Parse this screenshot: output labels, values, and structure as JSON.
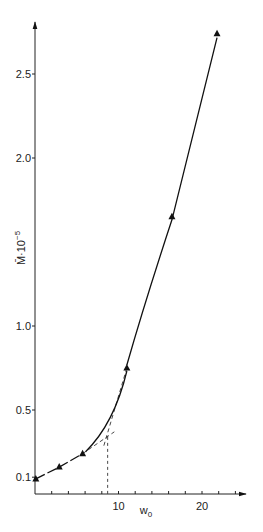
{
  "chart_data": {
    "type": "line",
    "title": "",
    "xlabel": "w0",
    "ylabel": "M̄·10⁻⁵",
    "x_ticks": [
      10,
      20
    ],
    "y_ticks": [
      0.1,
      0.5,
      1.0,
      2.0,
      2.5
    ],
    "x_tick_labels": [
      "10",
      "20"
    ],
    "y_tick_labels": [
      "0.1",
      "0.5",
      "1.0",
      "2.0",
      "2.5"
    ],
    "xlim": [
      0,
      25
    ],
    "ylim": [
      0,
      2.8
    ],
    "grid": false,
    "legend": null,
    "series": [
      {
        "name": "measured",
        "marker": "triangle",
        "x": [
          0.1,
          2.9,
          5.7,
          11.0,
          16.4,
          21.8
        ],
        "y": [
          0.09,
          0.16,
          0.24,
          0.75,
          1.65,
          2.74
        ]
      }
    ],
    "annotations": [
      {
        "type": "dashed-tangent-low",
        "from": [
          5.7,
          0.24
        ],
        "to": [
          9.5,
          0.37
        ]
      },
      {
        "type": "dashed-tangent-high",
        "from": [
          11.0,
          0.75
        ],
        "to": [
          8.2,
          0.28
        ]
      },
      {
        "type": "intersection",
        "x": 8.7,
        "y": 0.34
      },
      {
        "type": "dashed-drop-line",
        "x": 8.7,
        "from_y": 0.34,
        "to_y": 0
      }
    ]
  },
  "axis": {
    "xlabel_main": "w",
    "xlabel_sub": "0",
    "ylabel_main": "M̄·10",
    "ylabel_sup": "−5"
  }
}
